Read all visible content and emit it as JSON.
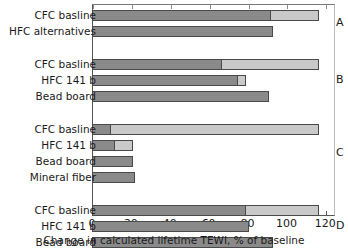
{
  "chart_data": {
    "type": "bar",
    "orientation": "horizontal",
    "stacked": true,
    "title": "",
    "xlabel": "Change in calculated lifetime TEWI, % of baseline",
    "ylabel": "",
    "xlim": [
      0,
      125
    ],
    "xticks": [
      0,
      20,
      40,
      60,
      80,
      100,
      120
    ],
    "xticklabels": [
      "0",
      "20",
      "40",
      "60",
      "80",
      "100",
      "120"
    ],
    "grid": false,
    "legend": "none",
    "series": [
      {
        "name": "segment-1",
        "color": "#8a8a8a"
      },
      {
        "name": "segment-2",
        "color": "#c9c9c9"
      }
    ],
    "groups": [
      {
        "letter": "A",
        "bars": [
          {
            "label": "CFC basline",
            "segment1": 92,
            "segment2": 25,
            "total": 117
          },
          {
            "label": "HFC alternatives",
            "segment1": 93,
            "segment2": 0,
            "total": 93
          }
        ]
      },
      {
        "letter": "B",
        "bars": [
          {
            "label": "CFC basline",
            "segment1": 67,
            "segment2": 50,
            "total": 117
          },
          {
            "label": "HFC 141 b",
            "segment1": 75,
            "segment2": 4,
            "total": 79
          },
          {
            "label": "Bead board",
            "segment1": 91,
            "segment2": 0,
            "total": 91
          }
        ]
      },
      {
        "letter": "C",
        "bars": [
          {
            "label": "CFC basline",
            "segment1": 10,
            "segment2": 107,
            "total": 117
          },
          {
            "label": "HFC 141 b",
            "segment1": 12,
            "segment2": 9,
            "total": 21
          },
          {
            "label": "Bead board",
            "segment1": 21,
            "segment2": 0,
            "total": 21
          },
          {
            "label": "Mineral fiber",
            "segment1": 22,
            "segment2": 0,
            "total": 22
          }
        ]
      },
      {
        "letter": "D",
        "bars": [
          {
            "label": "CFC basline",
            "segment1": 79,
            "segment2": 38,
            "total": 117
          },
          {
            "label": "HFC 141 b",
            "segment1": 81,
            "segment2": 0,
            "total": 81
          },
          {
            "label": "Bead board",
            "segment1": 93,
            "segment2": 0,
            "total": 93
          }
        ]
      }
    ]
  }
}
